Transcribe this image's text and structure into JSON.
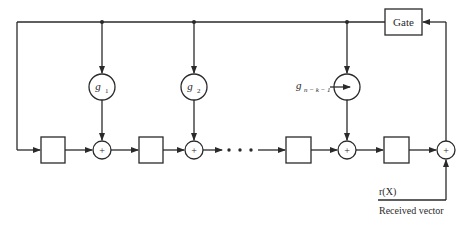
{
  "diagram": {
    "gate_label": "Gate",
    "taps": [
      {
        "symbol": "g",
        "subscript": "1"
      },
      {
        "symbol": "g",
        "subscript": "2"
      },
      {
        "symbol": "g",
        "subscript": "n − k − 1"
      }
    ],
    "adder_symbol": "+",
    "ellipsis": "• • •",
    "input_label": "r(X)",
    "input_caption": "Received vector"
  }
}
